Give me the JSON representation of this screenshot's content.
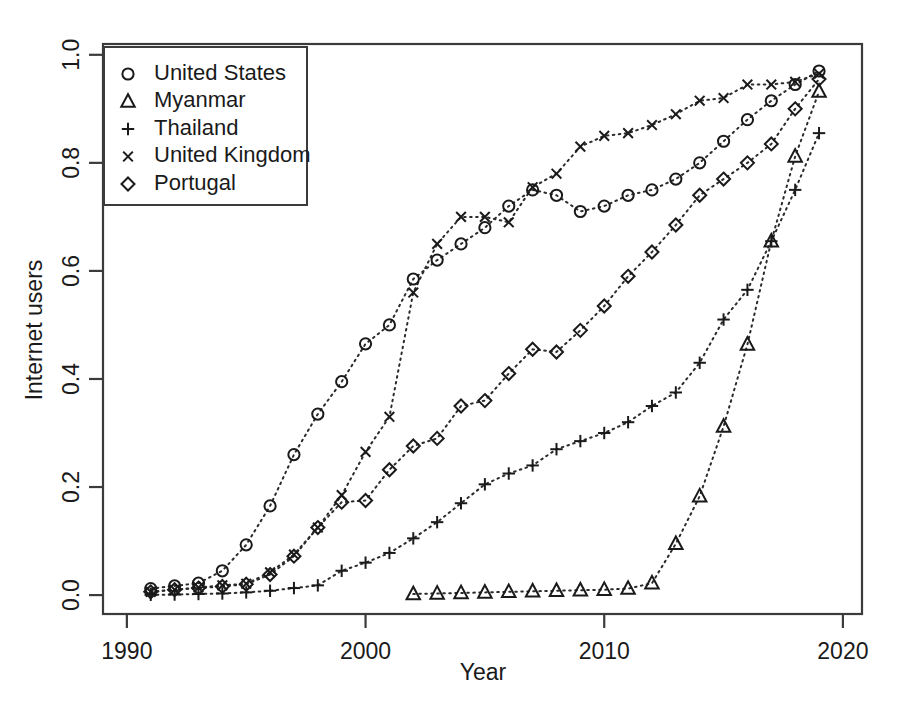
{
  "chart_data": {
    "type": "scatter",
    "title": "",
    "xlabel": "Year",
    "ylabel": "Internet users",
    "xlim": [
      1989.0,
      2020.8
    ],
    "ylim": [
      -0.035,
      1.02
    ],
    "xticks": [
      1990,
      2000,
      2010,
      2020
    ],
    "yticks": [
      0.0,
      0.2,
      0.4,
      0.6,
      0.8,
      1.0
    ],
    "ytick_labels": [
      "0.0",
      "0.2",
      "0.4",
      "0.6",
      "0.8",
      "1.0"
    ],
    "xtick_labels": [
      "1990",
      "2000",
      "2010",
      "2020"
    ],
    "grid": false,
    "legend_position": "top-left",
    "connector_style": "dotted",
    "series": [
      {
        "name": "United States",
        "marker": "circle",
        "x": [
          1991,
          1992,
          1993,
          1994,
          1995,
          1996,
          1997,
          1998,
          1999,
          2000,
          2001,
          2002,
          2003,
          2004,
          2005,
          2006,
          2007,
          2008,
          2009,
          2010,
          2011,
          2012,
          2013,
          2014,
          2015,
          2016,
          2017,
          2018,
          2019
        ],
        "values": [
          0.012,
          0.017,
          0.022,
          0.045,
          0.093,
          0.165,
          0.26,
          0.335,
          0.395,
          0.465,
          0.5,
          0.585,
          0.62,
          0.65,
          0.68,
          0.72,
          0.75,
          0.74,
          0.71,
          0.72,
          0.74,
          0.75,
          0.77,
          0.8,
          0.84,
          0.88,
          0.915,
          0.945,
          0.97
        ]
      },
      {
        "name": "Myanmar",
        "marker": "triangle",
        "x": [
          2002,
          2003,
          2004,
          2005,
          2006,
          2007,
          2008,
          2009,
          2010,
          2011,
          2012,
          2013,
          2014,
          2015,
          2016,
          2017,
          2018,
          2019
        ],
        "values": [
          0.002,
          0.003,
          0.004,
          0.005,
          0.006,
          0.007,
          0.008,
          0.009,
          0.01,
          0.012,
          0.022,
          0.095,
          0.183,
          0.312,
          0.464,
          0.655,
          0.812,
          0.932
        ]
      },
      {
        "name": "Thailand",
        "marker": "plus",
        "x": [
          1991,
          1992,
          1993,
          1994,
          1995,
          1996,
          1997,
          1998,
          1999,
          2000,
          2001,
          2002,
          2003,
          2004,
          2005,
          2006,
          2007,
          2008,
          2009,
          2010,
          2011,
          2012,
          2013,
          2014,
          2015,
          2016,
          2017,
          2018,
          2019
        ],
        "values": [
          0.0005,
          0.001,
          0.002,
          0.003,
          0.005,
          0.008,
          0.013,
          0.018,
          0.045,
          0.06,
          0.078,
          0.105,
          0.135,
          0.17,
          0.205,
          0.225,
          0.24,
          0.27,
          0.285,
          0.3,
          0.32,
          0.35,
          0.375,
          0.43,
          0.51,
          0.565,
          0.655,
          0.75,
          0.855
        ]
      },
      {
        "name": "United Kingdom",
        "marker": "x",
        "x": [
          1991,
          1992,
          1993,
          1994,
          1995,
          1996,
          1997,
          1998,
          1999,
          2000,
          2001,
          2002,
          2003,
          2004,
          2005,
          2006,
          2007,
          2008,
          2009,
          2010,
          2011,
          2012,
          2013,
          2014,
          2015,
          2016,
          2017,
          2018,
          2019
        ],
        "values": [
          0.006,
          0.01,
          0.014,
          0.018,
          0.021,
          0.042,
          0.075,
          0.125,
          0.185,
          0.265,
          0.33,
          0.56,
          0.65,
          0.7,
          0.7,
          0.69,
          0.755,
          0.78,
          0.83,
          0.85,
          0.855,
          0.87,
          0.89,
          0.915,
          0.92,
          0.945,
          0.945,
          0.95,
          0.965
        ]
      },
      {
        "name": "Portugal",
        "marker": "diamond",
        "x": [
          1991,
          1992,
          1993,
          1994,
          1995,
          1996,
          1997,
          1998,
          1999,
          2000,
          2001,
          2002,
          2003,
          2004,
          2005,
          2006,
          2007,
          2008,
          2009,
          2010,
          2011,
          2012,
          2013,
          2014,
          2015,
          2016,
          2017,
          2018,
          2019
        ],
        "values": [
          0.006,
          0.01,
          0.013,
          0.016,
          0.02,
          0.038,
          0.072,
          0.125,
          0.172,
          0.175,
          0.232,
          0.276,
          0.29,
          0.35,
          0.36,
          0.41,
          0.455,
          0.45,
          0.49,
          0.535,
          0.59,
          0.635,
          0.685,
          0.74,
          0.77,
          0.8,
          0.835,
          0.9,
          0.955
        ]
      }
    ]
  },
  "legend": {
    "entries": [
      {
        "label": "United States",
        "marker": "circle"
      },
      {
        "label": "Myanmar",
        "marker": "triangle"
      },
      {
        "label": "Thailand",
        "marker": "plus"
      },
      {
        "label": "United Kingdom",
        "marker": "x"
      },
      {
        "label": "Portugal",
        "marker": "diamond"
      }
    ]
  },
  "axes": {
    "x_title": "Year",
    "y_title": "Internet users"
  }
}
